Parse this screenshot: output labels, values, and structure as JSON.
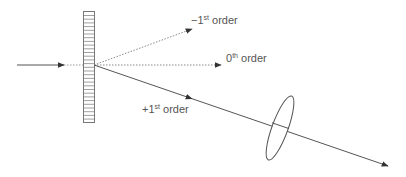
{
  "diagram": {
    "colors": {
      "line": "#555555",
      "dotted": "#8a8a8a",
      "text": "#555555",
      "grating": "#777777"
    },
    "labels": {
      "minus_first": {
        "prefix": "−1",
        "sup": "st",
        "suffix": " order"
      },
      "zeroth": {
        "prefix": "0",
        "sup": "th",
        "suffix": " order"
      },
      "plus_first": {
        "prefix": "+1",
        "sup": "st",
        "suffix": " order"
      }
    },
    "elements": [
      {
        "name": "incident-beam",
        "type": "solid-arrow"
      },
      {
        "name": "diffraction-grating",
        "type": "grating"
      },
      {
        "name": "minus-first-order-beam",
        "type": "dotted-arrow"
      },
      {
        "name": "zeroth-order-beam",
        "type": "dotted-arrow"
      },
      {
        "name": "plus-first-order-beam",
        "type": "solid-arrow"
      },
      {
        "name": "lens",
        "type": "ellipse"
      }
    ]
  }
}
